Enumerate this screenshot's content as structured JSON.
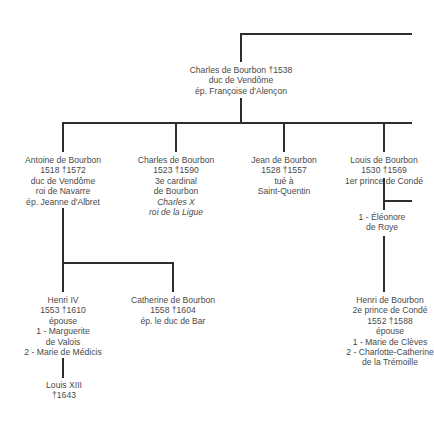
{
  "diagram": {
    "type": "genealogical-tree",
    "family": "House of Bourbon",
    "nodes": {
      "root": {
        "lines": [
          "Charles de Bourbon †1538",
          "duc de Vendôme",
          "ép. Françoise d'Alençon"
        ]
      },
      "antoine": {
        "lines": [
          "Antoine de Bourbon",
          "1518 †1572",
          "duc de Vendôme",
          "roi de Navarre",
          "ép. Jeanne d'Albret"
        ]
      },
      "charles_cardinal": {
        "lines": [
          "Charles de Bourbon",
          "1523 †1590",
          "3e cardinal",
          "de Bourbon"
        ],
        "italic_lines": [
          "Charles X",
          "roi de la Ligue"
        ]
      },
      "jean": {
        "lines": [
          "Jean de Bourbon",
          "1528 †1557",
          "tué à",
          "Saint-Quentin"
        ]
      },
      "louis_conde": {
        "lines": [
          "Louis de Bourbon",
          "1530 †1569",
          "1er prince de Condé"
        ]
      },
      "eleonore": {
        "lines": [
          "1 - Éléonore",
          "de Roye"
        ]
      },
      "henri_iv": {
        "lines": [
          "Henri IV",
          "1553 †1610",
          "épouse",
          "1 - Marguerite",
          "de Valois",
          "2 - Marie de Médicis"
        ]
      },
      "catherine": {
        "lines": [
          "Catherine de Bourbon",
          "1558 †1604",
          "ép. le duc de Bar"
        ]
      },
      "louis_xiii": {
        "lines": [
          "Louis XIII",
          "†1643"
        ]
      },
      "henri_conde": {
        "lines": [
          "Henri de Bourbon",
          "2e prince de Condé",
          "1552 †1588",
          "épouse",
          "1 - Marie de Clèves",
          "2 - Charlotte-Catherine",
          "de la Trémoille"
        ]
      }
    },
    "edges": [
      [
        "root",
        "antoine"
      ],
      [
        "root",
        "charles_cardinal"
      ],
      [
        "root",
        "jean"
      ],
      [
        "root",
        "louis_conde"
      ],
      [
        "antoine",
        "henri_iv"
      ],
      [
        "antoine",
        "catherine"
      ],
      [
        "henri_iv",
        "louis_xiii"
      ],
      [
        "louis_conde",
        "henri_conde"
      ]
    ],
    "colors": {
      "line": "#2e2e2e",
      "text": "#4a4a4a",
      "background": "#ffffff"
    }
  }
}
